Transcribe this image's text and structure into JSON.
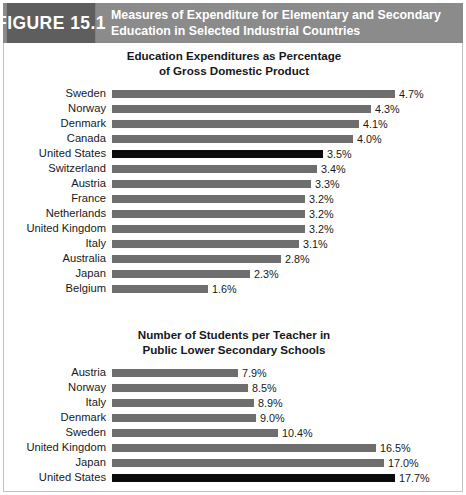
{
  "figure": {
    "badge_label": "FIGURE 15.1",
    "title_line_1": "Measures of Expenditure for Elementary and Secondary",
    "title_line_2": "Education in Selected Industrial Countries",
    "header_bg": "#8b8b8b",
    "badge_bg": "#5e5e5e",
    "bar_color": "#6e6e6e",
    "highlight_color": "#0b0b0b",
    "border_color": "#c2c2c2"
  },
  "chart_data": [
    {
      "type": "bar",
      "orientation": "horizontal",
      "title": "Education Expenditures as Percentage of Gross Domestic Product",
      "title_line_1": "Education Expenditures as Percentage",
      "title_line_2": "of Gross Domestic Product",
      "xlabel": "",
      "ylabel": "",
      "grid": false,
      "legend": "none",
      "xlim": [
        0,
        4.7
      ],
      "unit": "%",
      "categories": [
        "Sweden",
        "Norway",
        "Denmark",
        "Canada",
        "United States",
        "Switzerland",
        "Austria",
        "France",
        "Netherlands",
        "United Kingdom",
        "Italy",
        "Australia",
        "Japan",
        "Belgium"
      ],
      "values": [
        4.7,
        4.3,
        4.1,
        4.0,
        3.5,
        3.4,
        3.3,
        3.2,
        3.2,
        3.2,
        3.1,
        2.8,
        2.3,
        1.6
      ],
      "value_labels": [
        "4.7%",
        "4.3%",
        "4.1%",
        "4.0%",
        "3.5%",
        "3.4%",
        "3.3%",
        "3.2%",
        "3.2%",
        "3.2%",
        "3.1%",
        "2.8%",
        "2.3%",
        "1.6%"
      ],
      "highlighted": [
        "United States"
      ],
      "rows": [
        {
          "label": "Sweden",
          "value": 4.7,
          "value_label": "4.7%",
          "highlight": false
        },
        {
          "label": "Norway",
          "value": 4.3,
          "value_label": "4.3%",
          "highlight": false
        },
        {
          "label": "Denmark",
          "value": 4.1,
          "value_label": "4.1%",
          "highlight": false
        },
        {
          "label": "Canada",
          "value": 4.0,
          "value_label": "4.0%",
          "highlight": false
        },
        {
          "label": "United States",
          "value": 3.5,
          "value_label": "3.5%",
          "highlight": true
        },
        {
          "label": "Switzerland",
          "value": 3.4,
          "value_label": "3.4%",
          "highlight": false
        },
        {
          "label": "Austria",
          "value": 3.3,
          "value_label": "3.3%",
          "highlight": false
        },
        {
          "label": "France",
          "value": 3.2,
          "value_label": "3.2%",
          "highlight": false
        },
        {
          "label": "Netherlands",
          "value": 3.2,
          "value_label": "3.2%",
          "highlight": false
        },
        {
          "label": "United Kingdom",
          "value": 3.2,
          "value_label": "3.2%",
          "highlight": false
        },
        {
          "label": "Italy",
          "value": 3.1,
          "value_label": "3.1%",
          "highlight": false
        },
        {
          "label": "Australia",
          "value": 2.8,
          "value_label": "2.8%",
          "highlight": false
        },
        {
          "label": "Japan",
          "value": 2.3,
          "value_label": "2.3%",
          "highlight": false
        },
        {
          "label": "Belgium",
          "value": 1.6,
          "value_label": "1.6%",
          "highlight": false
        }
      ]
    },
    {
      "type": "bar",
      "orientation": "horizontal",
      "title": "Number of Students per Teacher in Public Lower Secondary Schools",
      "title_line_1": "Number of Students per Teacher in",
      "title_line_2": "Public Lower Secondary Schools",
      "xlabel": "",
      "ylabel": "",
      "grid": false,
      "legend": "none",
      "xlim": [
        0,
        17.7
      ],
      "unit": "%",
      "categories": [
        "Austria",
        "Norway",
        "Italy",
        "Denmark",
        "Sweden",
        "United Kingdom",
        "Japan",
        "United States"
      ],
      "values": [
        7.9,
        8.5,
        8.9,
        9.0,
        10.4,
        16.5,
        17.0,
        17.7
      ],
      "value_labels": [
        "7.9%",
        "8.5%",
        "8.9%",
        "9.0%",
        "10.4%",
        "16.5%",
        "17.0%",
        "17.7%"
      ],
      "highlighted": [
        "United States"
      ],
      "rows": [
        {
          "label": "Austria",
          "value": 7.9,
          "value_label": "7.9%",
          "highlight": false
        },
        {
          "label": "Norway",
          "value": 8.5,
          "value_label": "8.5%",
          "highlight": false
        },
        {
          "label": "Italy",
          "value": 8.9,
          "value_label": "8.9%",
          "highlight": false
        },
        {
          "label": "Denmark",
          "value": 9.0,
          "value_label": "9.0%",
          "highlight": false
        },
        {
          "label": "Sweden",
          "value": 10.4,
          "value_label": "10.4%",
          "highlight": false
        },
        {
          "label": "United Kingdom",
          "value": 16.5,
          "value_label": "16.5%",
          "highlight": false
        },
        {
          "label": "Japan",
          "value": 17.0,
          "value_label": "17.0%",
          "highlight": false
        },
        {
          "label": "United States",
          "value": 17.7,
          "value_label": "17.7%",
          "highlight": true
        }
      ]
    }
  ]
}
